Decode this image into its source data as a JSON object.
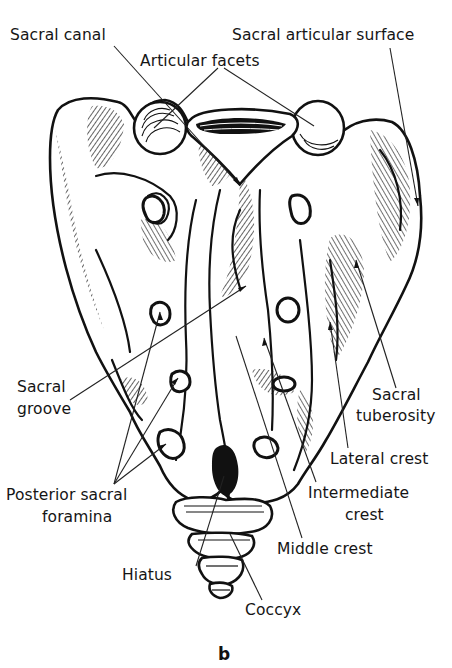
{
  "figure": {
    "panel_letter": "b",
    "labels": {
      "sacral_canal": "Sacral canal",
      "sacral_articular_surface": "Sacral articular surface",
      "articular_facets": "Articular facets",
      "sacral_groove_line1": "Sacral",
      "sacral_groove_line2": "groove",
      "sacral_tuberosity_line1": "Sacral",
      "sacral_tuberosity_line2": "tuberosity",
      "lateral_crest": "Lateral crest",
      "posterior_sacral_foramina_line1": "Posterior sacral",
      "posterior_sacral_foramina_line2": "foramina",
      "intermediate_crest_line1": "Intermediate",
      "intermediate_crest_line2": "crest",
      "middle_crest": "Middle crest",
      "hiatus": "Hiatus",
      "coccyx": "Coccyx"
    },
    "colors": {
      "ink": "#151515",
      "background": "#ffffff"
    }
  }
}
